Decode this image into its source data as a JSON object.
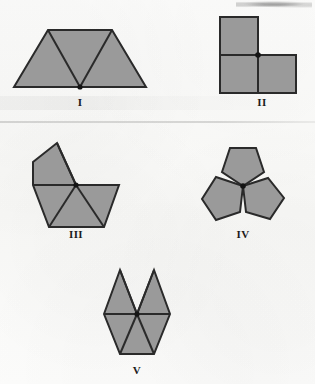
{
  "page": {
    "kind": "scanned-geometry-figure",
    "width": 315,
    "height": 384,
    "background_color": "#fbfbfa",
    "shape_fill_color": "#9a9a9a",
    "shape_stroke_color": "#2a2a2a",
    "vertex_dot_color": "#141414",
    "label_color": "#1c1c1c"
  },
  "figures": [
    {
      "id": "figure-1",
      "label": "I",
      "label_x": 80,
      "label_y": 96,
      "description": "Trapezoid formed by three equilateral triangles sharing a common bottom vertex",
      "shape_type": "equilateral-triangle",
      "polygon_count": 3,
      "vertex_dot": {
        "x": 80,
        "y": 87
      },
      "outline_points": "14,87 48,30 112,30 146,87",
      "inner_edges": [
        "48,30 80,87",
        "112,30 80,87"
      ]
    },
    {
      "id": "figure-2",
      "label": "II",
      "label_x": 262,
      "label_y": 96,
      "description": "Three squares in an L arrangement sharing a common corner vertex",
      "shape_type": "square",
      "polygon_count": 3,
      "vertex_dot": {
        "x": 258,
        "y": 55
      },
      "outline_points": "220,17 258,17 258,55 296,55 296,93 220,93",
      "inner_edges": [
        "220,55 296,55",
        "258,17 258,93"
      ]
    },
    {
      "id": "figure-3",
      "label": "III",
      "label_x": 76,
      "label_y": 228,
      "description": "Tilted square plus three triangles meeting at a common vertex",
      "shape_type": "mixed-square-and-triangle",
      "polygon_count": 4,
      "vertex_dot": {
        "x": 76,
        "y": 185
      },
      "outline_points": "33,162 57,143 76,185 119,185 104,227 49,227 33,185",
      "inner_edges": [
        "33,185 119,185",
        "57,143 76,185",
        "49,227 76,185",
        "104,227 76,185"
      ]
    },
    {
      "id": "figure-4",
      "label": "IV",
      "label_x": 243,
      "label_y": 228,
      "description": "Three regular pentagons meeting at a common vertex leaving an angular gap",
      "shape_type": "regular-pentagon",
      "polygon_count": 3,
      "vertex_dot": {
        "x": 243,
        "y": 186
      },
      "pentagons": [
        "243,186 222,172 230,148 256,148 264,172",
        "243,186 240,212 216,220 202,199 216,177",
        "243,186 268,178 284,198 270,219 246,212"
      ]
    },
    {
      "id": "figure-5",
      "label": "V",
      "label_x": 137,
      "label_y": 364,
      "description": "Five equilateral triangles around a common vertex, leaving a V-shaped gap at the top",
      "shape_type": "equilateral-triangle",
      "polygon_count": 5,
      "vertex_dot": {
        "x": 137,
        "y": 314
      },
      "outline_points": "104,314 120,270 137,314 154,270 170,314 154,354 120,354",
      "inner_edges": [
        "104,314 170,314",
        "120,270 137,314",
        "154,270 137,314",
        "120,354 137,314",
        "154,354 137,314"
      ]
    }
  ]
}
